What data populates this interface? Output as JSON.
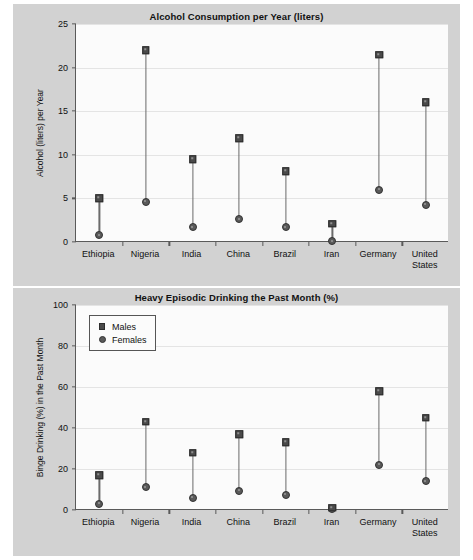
{
  "chart_data": [
    {
      "type": "scatter",
      "id": "alcohol-consumption",
      "title": "Alcohol Consumption per Year (liters)",
      "xlabel": "",
      "ylabel": "Alcohol (liters) per Year",
      "ylim": [
        0,
        25
      ],
      "yticks": [
        0,
        5,
        10,
        15,
        20,
        25
      ],
      "grid": true,
      "legend": null,
      "categories": [
        "Ethiopia",
        "Nigeria",
        "India",
        "China",
        "Brazil",
        "Iran",
        "Germany",
        "United\nStates"
      ],
      "series": [
        {
          "name": "Males",
          "marker": "square",
          "values": [
            5.0,
            22.0,
            9.5,
            11.9,
            8.1,
            2.1,
            21.5,
            16.0
          ]
        },
        {
          "name": "Females",
          "marker": "circle",
          "values": [
            0.8,
            4.6,
            1.7,
            2.6,
            1.7,
            0.1,
            6.0,
            4.3
          ]
        }
      ]
    },
    {
      "type": "scatter",
      "id": "heavy-episodic-drinking",
      "title": "Heavy Episodic Drinking the Past Month (%)",
      "xlabel": "",
      "ylabel": "Binge Drinking (%) in the Past Month",
      "ylim": [
        0,
        100
      ],
      "yticks": [
        0,
        20,
        40,
        60,
        80,
        100
      ],
      "grid": true,
      "legend": {
        "position": "top-left",
        "entries": [
          "Males",
          "Females"
        ]
      },
      "categories": [
        "Ethiopia",
        "Nigeria",
        "India",
        "China",
        "Brazil",
        "Iran",
        "Germany",
        "United\nStates"
      ],
      "series": [
        {
          "name": "Males",
          "marker": "square",
          "values": [
            17.0,
            43.0,
            28.0,
            37.0,
            33.0,
            1.0,
            58.0,
            45.0
          ]
        },
        {
          "name": "Females",
          "marker": "circle",
          "values": [
            3.0,
            11.0,
            6.0,
            9.5,
            7.5,
            0.3,
            22.0,
            14.0
          ]
        }
      ]
    }
  ],
  "colors": {
    "figure_background": "#d2d2d2",
    "plot_background": "#fbfbfb",
    "axis": "#5a5a5a",
    "gridline": "#e4e4e4",
    "male_marker": "#4a4a4a",
    "female_marker": "#5a5a5a",
    "stem": "#6b6b6b",
    "text": "#111111"
  }
}
